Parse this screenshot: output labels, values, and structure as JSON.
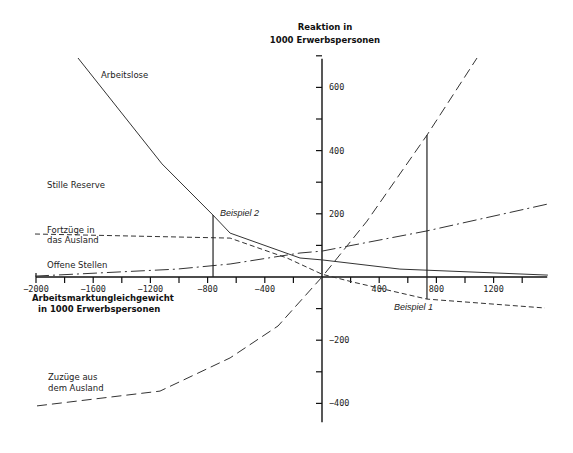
{
  "chart_data": {
    "type": "line",
    "title": "",
    "ylabel": "Reaktion in 1000 Erwerbspersonen",
    "xlabel": "Arbeitsmarktungleichgewicht in 1000 Erwerbspersonen",
    "xlim": [
      -2000,
      1575
    ],
    "ylim": [
      -460,
      700
    ],
    "x_ticks_step": 200,
    "y_ticks_step": 100,
    "x_tick_labels": [
      -2000,
      -1600,
      -1200,
      -800,
      -400,
      400,
      800,
      1200
    ],
    "y_tick_labels": [
      600,
      400,
      200,
      -200,
      -400
    ],
    "grid": false,
    "legend": "inline labels",
    "series": [
      {
        "name": "Arbeitslose",
        "style": "solid",
        "points": [
          [
            -1706,
            693
          ],
          [
            -1119,
            358
          ],
          [
            -762,
            196
          ],
          [
            -643,
            139
          ],
          [
            -154,
            60
          ],
          [
            0,
            54
          ],
          [
            545,
            25
          ],
          [
            1580,
            6
          ]
        ]
      },
      {
        "name": "Fortzüge in das Ausland",
        "style": "short-dash",
        "points": [
          [
            -2007,
            136
          ],
          [
            -643,
            123
          ],
          [
            -245,
            60
          ],
          [
            0,
            9
          ],
          [
            217,
            -16
          ],
          [
            734,
            -70
          ],
          [
            1559,
            -98
          ]
        ]
      },
      {
        "name": "Offene Stellen",
        "style": "dash-dot",
        "points": [
          [
            -2007,
            3
          ],
          [
            -1014,
            25
          ],
          [
            -643,
            41
          ],
          [
            -154,
            76
          ],
          [
            0,
            82
          ],
          [
            734,
            146
          ],
          [
            1580,
            231
          ]
        ]
      },
      {
        "name": "Zuzüge aus dem Ausland",
        "style": "long-dash",
        "points": [
          [
            -1993,
            -408
          ],
          [
            -1133,
            -361
          ],
          [
            -643,
            -256
          ],
          [
            -308,
            -155
          ],
          [
            0,
            0
          ],
          [
            315,
            177
          ],
          [
            734,
            449
          ],
          [
            1084,
            693
          ]
        ]
      }
    ],
    "annotations": [
      {
        "text": "Beispiel 1",
        "x": 734,
        "y_from": 449,
        "y_to": -70
      },
      {
        "text": "Beispiel 2",
        "x": -762,
        "y_from": 196,
        "y_to": 0
      }
    ],
    "unlabeled_category_text": "Stille Reserve"
  },
  "labels": {
    "y_title_line1": "Reaktion in",
    "y_title_line2": "1000 Erwerbspersonen",
    "x_title_line1": "Arbeitsmarktungleichgewicht",
    "x_title_line2": "in 1000 Erwerbspersonen",
    "arbeitslose": "Arbeitslose",
    "stille_reserve": "Stille Reserve",
    "fortzuege_line1": "Fortzüge in",
    "fortzuege_line2": "das Ausland",
    "offene_stellen": "Offene Stellen",
    "zuzuege_line1": "Zuzüge aus",
    "zuzuege_line2": "dem Ausland",
    "beispiel_1": "Beispiel 1",
    "beispiel_2": "Beispiel 2"
  }
}
